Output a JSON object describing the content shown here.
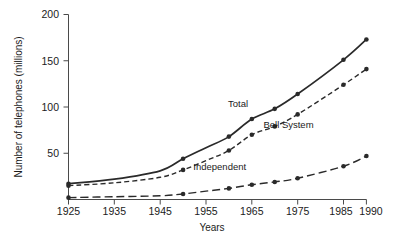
{
  "chart_data": {
    "type": "line",
    "title": "",
    "xlabel": "Years",
    "ylabel": "Number of telephones (millions)",
    "xlim": [
      1925,
      1990
    ],
    "ylim": [
      0,
      200
    ],
    "grid": false,
    "legend": "inline-annotations",
    "xticks": [
      1925,
      1935,
      1945,
      1955,
      1965,
      1975,
      1985,
      1990
    ],
    "xtick_labels": [
      "1925",
      "1935",
      "1945",
      "1955",
      "1965",
      "1975",
      "1985",
      "1990"
    ],
    "yticks": [
      50,
      100,
      150,
      200
    ],
    "ytick_labels": [
      "50",
      "100",
      "150",
      "200"
    ],
    "x": [
      1925,
      1935,
      1945,
      1950,
      1955,
      1960,
      1965,
      1970,
      1975,
      1985,
      1990
    ],
    "series": [
      {
        "name": "Total",
        "label": "Total",
        "style": "solid",
        "color": "#2a2a2a",
        "values": [
          17,
          22,
          31,
          44,
          56,
          68,
          87,
          98,
          114,
          151,
          173
        ],
        "marked_points": [
          1925,
          1950,
          1960,
          1965,
          1970,
          1975,
          1985,
          1990
        ]
      },
      {
        "name": "Bell System",
        "label": "Bell System",
        "style": "dashed",
        "color": "#2a2a2a",
        "values": [
          15,
          18,
          24,
          32,
          42,
          53,
          70,
          79,
          92,
          124,
          141
        ],
        "marked_points": [
          1925,
          1950,
          1960,
          1965,
          1970,
          1975,
          1985,
          1990
        ]
      },
      {
        "name": "Independent",
        "label": "Independent",
        "style": "long-dash",
        "color": "#2a2a2a",
        "values": [
          2,
          3,
          4,
          6,
          9,
          12,
          16,
          19,
          23,
          36,
          47
        ],
        "marked_points": [
          1925,
          1950,
          1960,
          1965,
          1970,
          1975,
          1985,
          1990
        ]
      }
    ],
    "annotations": [
      {
        "text": "Total",
        "x": 1962,
        "y": 100
      },
      {
        "text": "Bell System",
        "x": 1973,
        "y": 77
      },
      {
        "text": "Independent",
        "x": 1958,
        "y": 32
      }
    ]
  },
  "figure": {
    "caption_stub": ""
  }
}
